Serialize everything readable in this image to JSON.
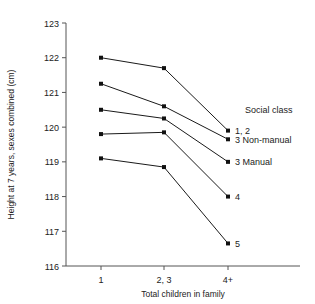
{
  "chart_data": {
    "type": "line",
    "title": "",
    "xlabel": "Total children in family",
    "ylabel": "Height at 7 years, sexes combined (cm)",
    "categories": [
      "1",
      "2, 3",
      "4+"
    ],
    "ylim": [
      116,
      123
    ],
    "yticks": [
      116,
      117,
      118,
      119,
      120,
      121,
      122,
      123
    ],
    "ytick_labels": [
      "116",
      "117",
      "118",
      "119",
      "120",
      "121",
      "122",
      "123"
    ],
    "grid": false,
    "legend_position": "right-inline",
    "legend_title": "Social class",
    "series": [
      {
        "name": "1, 2",
        "label": "1, 2",
        "values": [
          122.0,
          121.7,
          119.9
        ]
      },
      {
        "name": "3 Non-manual",
        "label": "3 Non-manual",
        "values": [
          121.25,
          120.6,
          119.65
        ]
      },
      {
        "name": "3 Manual",
        "label": "3 Manual",
        "values": [
          120.5,
          120.25,
          119.0
        ]
      },
      {
        "name": "4",
        "label": "4",
        "values": [
          119.8,
          119.85,
          118.0
        ]
      },
      {
        "name": "5",
        "label": "5",
        "values": [
          119.1,
          118.85,
          116.65
        ]
      }
    ]
  }
}
